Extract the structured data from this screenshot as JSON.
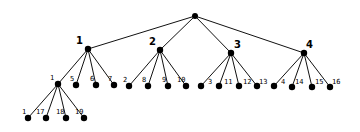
{
  "diagram": {
    "type": "tree",
    "colors": {
      "edge": "#111111",
      "node": "#000000",
      "background": "#ffffff"
    },
    "nodes": [
      {
        "id": "root",
        "label": "",
        "x": 195,
        "y": 16,
        "level": 0
      },
      {
        "id": "n1",
        "label": "1",
        "x": 88,
        "y": 49,
        "level": 1,
        "lx": 76,
        "ly": 44
      },
      {
        "id": "n2",
        "label": "2",
        "x": 160,
        "y": 50,
        "level": 1,
        "lx": 149,
        "ly": 45
      },
      {
        "id": "n3",
        "label": "3",
        "x": 231,
        "y": 53,
        "level": 1,
        "lx": 234,
        "ly": 48
      },
      {
        "id": "n4",
        "label": "4",
        "x": 304,
        "y": 53,
        "level": 1,
        "lx": 306,
        "ly": 48
      },
      {
        "id": "n1_1",
        "label": "1",
        "x": 58,
        "y": 84,
        "level": 2,
        "lx": 50,
        "ly": 80
      },
      {
        "id": "n1_5",
        "label": "5",
        "x": 76,
        "y": 85,
        "level": 2,
        "lx": 70,
        "ly": 81
      },
      {
        "id": "n1_6",
        "label": "6",
        "x": 96,
        "y": 85,
        "level": 2,
        "lx": 90,
        "ly": 81
      },
      {
        "id": "n1_7",
        "label": "7",
        "x": 114,
        "y": 85,
        "level": 2,
        "lx": 108,
        "ly": 81
      },
      {
        "id": "n2_2",
        "label": "2",
        "x": 129,
        "y": 86,
        "level": 2,
        "lx": 123,
        "ly": 82
      },
      {
        "id": "n2_8",
        "label": "8",
        "x": 148,
        "y": 86,
        "level": 2,
        "lx": 142,
        "ly": 82
      },
      {
        "id": "n2_9",
        "label": "9",
        "x": 168,
        "y": 86,
        "level": 2,
        "lx": 162,
        "ly": 82
      },
      {
        "id": "n2_10",
        "label": "10",
        "x": 186,
        "y": 86,
        "level": 2,
        "lx": 177,
        "ly": 82
      },
      {
        "id": "n3_3",
        "label": "3",
        "x": 201,
        "y": 86,
        "level": 2,
        "lx": 208,
        "ly": 84
      },
      {
        "id": "n3_11",
        "label": "11",
        "x": 219,
        "y": 86,
        "level": 2,
        "lx": 224,
        "ly": 84
      },
      {
        "id": "n3_12",
        "label": "12",
        "x": 239,
        "y": 86,
        "level": 2,
        "lx": 243,
        "ly": 84
      },
      {
        "id": "n3_13",
        "label": "13",
        "x": 257,
        "y": 86,
        "level": 2,
        "lx": 259,
        "ly": 84
      },
      {
        "id": "n4_4",
        "label": "4",
        "x": 274,
        "y": 86,
        "level": 2,
        "lx": 281,
        "ly": 84
      },
      {
        "id": "n4_14",
        "label": "14",
        "x": 292,
        "y": 87,
        "level": 2,
        "lx": 295,
        "ly": 84
      },
      {
        "id": "n4_15",
        "label": "15",
        "x": 312,
        "y": 87,
        "level": 2,
        "lx": 315,
        "ly": 84
      },
      {
        "id": "n4_16",
        "label": "16",
        "x": 330,
        "y": 87,
        "level": 2,
        "lx": 332,
        "ly": 84
      },
      {
        "id": "n1_1_1",
        "label": "1",
        "x": 28,
        "y": 118,
        "level": 3,
        "lx": 22,
        "ly": 114
      },
      {
        "id": "n1_1_17",
        "label": "17",
        "x": 46,
        "y": 118,
        "level": 3,
        "lx": 36,
        "ly": 114
      },
      {
        "id": "n1_1_18",
        "label": "18",
        "x": 66,
        "y": 118,
        "level": 3,
        "lx": 56,
        "ly": 114
      },
      {
        "id": "n1_1_19",
        "label": "19",
        "x": 84,
        "y": 118,
        "level": 3,
        "lx": 75,
        "ly": 114
      }
    ],
    "edges": [
      [
        "root",
        "n1"
      ],
      [
        "root",
        "n2"
      ],
      [
        "root",
        "n3"
      ],
      [
        "root",
        "n4"
      ],
      [
        "n1",
        "n1_1"
      ],
      [
        "n1",
        "n1_5"
      ],
      [
        "n1",
        "n1_6"
      ],
      [
        "n1",
        "n1_7"
      ],
      [
        "n2",
        "n2_2"
      ],
      [
        "n2",
        "n2_8"
      ],
      [
        "n2",
        "n2_9"
      ],
      [
        "n2",
        "n2_10"
      ],
      [
        "n3",
        "n3_3"
      ],
      [
        "n3",
        "n3_11"
      ],
      [
        "n3",
        "n3_12"
      ],
      [
        "n3",
        "n3_13"
      ],
      [
        "n4",
        "n4_4"
      ],
      [
        "n4",
        "n4_14"
      ],
      [
        "n4",
        "n4_15"
      ],
      [
        "n4",
        "n4_16"
      ],
      [
        "n1_1",
        "n1_1_1"
      ],
      [
        "n1_1",
        "n1_1_17"
      ],
      [
        "n1_1",
        "n1_1_18"
      ],
      [
        "n1_1",
        "n1_1_19"
      ]
    ]
  }
}
